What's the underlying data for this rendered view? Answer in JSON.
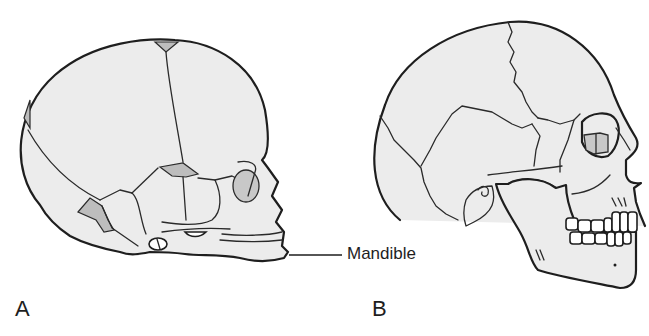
{
  "figure": {
    "panels": [
      {
        "id": "A",
        "label": "A",
        "subject": "infant-skull-lateral-view"
      },
      {
        "id": "B",
        "label": "B",
        "subject": "adult-skull-lateral-view"
      }
    ],
    "callouts": [
      {
        "label": "Mandible",
        "points_to": "panel-A-mandible"
      }
    ],
    "colors": {
      "background": "#ffffff",
      "bone_fill": "#ececec",
      "outline": "#1e1e1e",
      "fontanelle_fill": "#bdbdbd"
    }
  }
}
